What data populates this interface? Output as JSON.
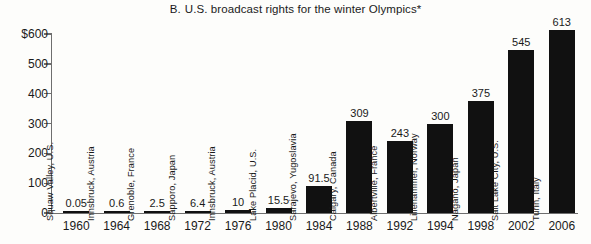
{
  "chart_data": {
    "type": "bar",
    "title_letter": "B.",
    "title_text": "U.S. broadcast rights for the winter Olympics*",
    "xlabel": "",
    "ylabel": "",
    "ylim": [
      0,
      600
    ],
    "grid": false,
    "legend": null,
    "y_ticks": [
      {
        "value": 600,
        "label": "$600"
      },
      {
        "value": 500,
        "label": "500"
      },
      {
        "value": 400,
        "label": "400"
      },
      {
        "value": 300,
        "label": "300"
      },
      {
        "value": 200,
        "label": "200"
      },
      {
        "value": 100,
        "label": "100"
      },
      {
        "value": 0,
        "label": "0"
      }
    ],
    "categories": [
      "1960",
      "1964",
      "1968",
      "1972",
      "1976",
      "1980",
      "1984",
      "1988",
      "1992",
      "1994",
      "1998",
      "2002",
      "2006"
    ],
    "values": [
      0.05,
      0.6,
      2.5,
      6.4,
      10,
      15.5,
      91.5,
      309,
      243,
      300,
      375,
      545,
      613
    ],
    "value_labels": [
      "0.05",
      "0.6",
      "2.5",
      "6.4",
      "10",
      "15.5",
      "91.5",
      "309",
      "243",
      "300",
      "375",
      "545",
      "613"
    ],
    "host_cities": [
      "Squaw Valley, U.S.",
      "Innsbruck, Austria",
      "Grenoble, France",
      "Sapporo, Japan",
      "Innsbruck, Austria",
      "Lake Placid, U.S.",
      "Sarajevo, Yugoslavia",
      "Calgary, Canada",
      "Albertville, France",
      "Lillehammer, Norway",
      "Nagano, Japan",
      "Salt Lake City, U.S.",
      "Turin, Italy"
    ],
    "points": [
      {
        "year": "1960",
        "city": "Squaw Valley, U.S.",
        "value": 0.05,
        "label": "0.05"
      },
      {
        "year": "1964",
        "city": "Innsbruck, Austria",
        "value": 0.6,
        "label": "0.6"
      },
      {
        "year": "1968",
        "city": "Grenoble, France",
        "value": 2.5,
        "label": "2.5"
      },
      {
        "year": "1972",
        "city": "Sapporo, Japan",
        "value": 6.4,
        "label": "6.4"
      },
      {
        "year": "1976",
        "city": "Innsbruck, Austria",
        "value": 10,
        "label": "10"
      },
      {
        "year": "1980",
        "city": "Lake Placid, U.S.",
        "value": 15.5,
        "label": "15.5"
      },
      {
        "year": "1984",
        "city": "Sarajevo, Yugoslavia",
        "value": 91.5,
        "label": "91.5"
      },
      {
        "year": "1988",
        "city": "Calgary, Canada",
        "value": 309,
        "label": "309"
      },
      {
        "year": "1992",
        "city": "Albertville, France",
        "value": 243,
        "label": "243"
      },
      {
        "year": "1994",
        "city": "Lillehammer, Norway",
        "value": 300,
        "label": "300"
      },
      {
        "year": "1998",
        "city": "Nagano, Japan",
        "value": 375,
        "label": "375"
      },
      {
        "year": "2002",
        "city": "Salt Lake City, U.S.",
        "value": 545,
        "label": "545"
      },
      {
        "year": "2006",
        "city": "Turin, Italy",
        "value": 613,
        "label": "613"
      }
    ],
    "colors": {
      "bar": "#111111",
      "axis": "#6e6e6e",
      "text": "#1a1a1a",
      "background": "#fdfdfb"
    }
  }
}
